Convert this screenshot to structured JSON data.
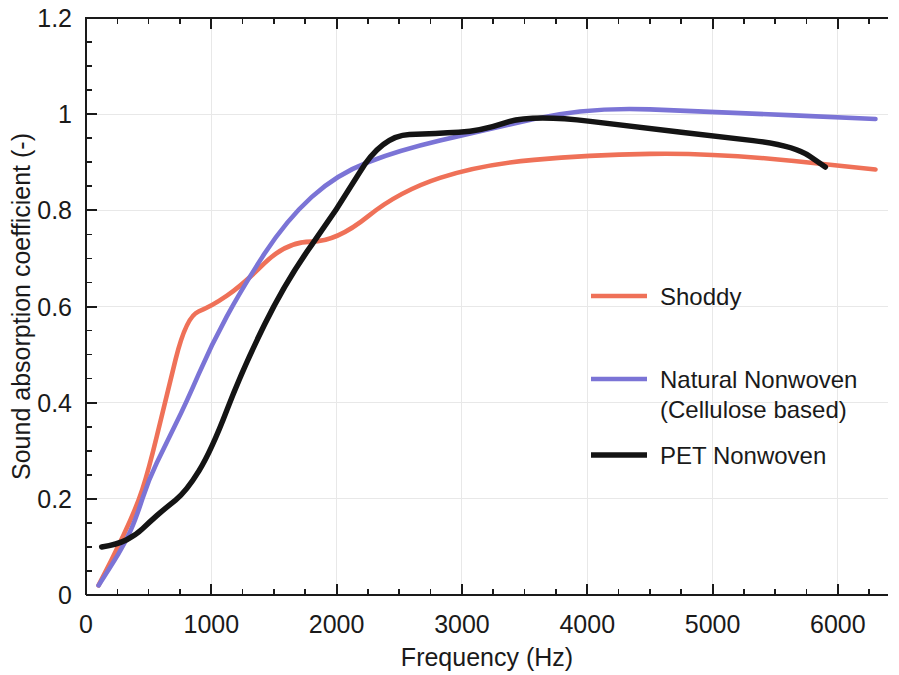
{
  "chart_data": {
    "type": "line",
    "title": "",
    "xlabel": "Frequency (Hz)",
    "ylabel": "Sound absorption coefficient (-)",
    "xlim": [
      0,
      6400
    ],
    "ylim": [
      0,
      1.2
    ],
    "xticks": [
      0,
      1000,
      2000,
      3000,
      4000,
      5000,
      6000
    ],
    "xticklabels": [
      "0",
      "1000",
      "2000",
      "3000",
      "4000",
      "5000",
      "6000"
    ],
    "yticks": [
      0,
      0.2,
      0.4,
      0.6,
      0.8,
      1,
      1.2
    ],
    "yticklabels": [
      "0",
      "0.2",
      "0.4",
      "0.6",
      "0.8",
      "1",
      "1.2"
    ],
    "minor_tick_interval_x": 250,
    "minor_tick_interval_y": 0.05,
    "grid": true,
    "legend_position": "center-right",
    "series": [
      {
        "name": "Shoddy",
        "color": "#ef7158",
        "x": [
          100,
          200,
          400,
          500,
          630,
          800,
          1000,
          1250,
          1600,
          2000,
          2500,
          3150,
          4000,
          5000,
          6300
        ],
        "y": [
          0.02,
          0.07,
          0.18,
          0.26,
          0.4,
          0.58,
          0.6,
          0.645,
          0.735,
          0.735,
          0.84,
          0.895,
          0.915,
          0.92,
          0.885
        ]
      },
      {
        "name": "Natural Nonwoven (Cellulose based)",
        "color": "#7b74d6",
        "x": [
          100,
          200,
          315,
          400,
          500,
          630,
          800,
          1000,
          1250,
          1600,
          2000,
          2500,
          3150,
          4000,
          5000,
          6300
        ],
        "y": [
          0.02,
          0.06,
          0.11,
          0.16,
          0.24,
          0.31,
          0.4,
          0.52,
          0.64,
          0.78,
          0.875,
          0.925,
          0.965,
          1.015,
          1.005,
          0.99
        ]
      },
      {
        "name": "PET Nonwoven",
        "color": "#141414",
        "x": [
          125,
          250,
          400,
          500,
          630,
          800,
          1000,
          1250,
          1600,
          2000,
          2360,
          2800,
          3150,
          3550,
          4500,
          5000,
          5650,
          5900
        ],
        "y": [
          0.1,
          0.105,
          0.125,
          0.15,
          0.18,
          0.215,
          0.3,
          0.47,
          0.655,
          0.8,
          0.955,
          0.96,
          0.965,
          1.0,
          0.97,
          0.955,
          0.935,
          0.89
        ]
      }
    ],
    "legend_entries": [
      {
        "label": "Shoddy",
        "color": "#ef7158",
        "lines": [
          "Shoddy"
        ]
      },
      {
        "label": "Natural Nonwoven (Cellulose based)",
        "color": "#7b74d6",
        "lines": [
          "Natural Nonwoven",
          "(Cellulose based)"
        ]
      },
      {
        "label": "PET Nonwoven",
        "color": "#141414",
        "lines": [
          "PET Nonwoven"
        ]
      }
    ]
  }
}
